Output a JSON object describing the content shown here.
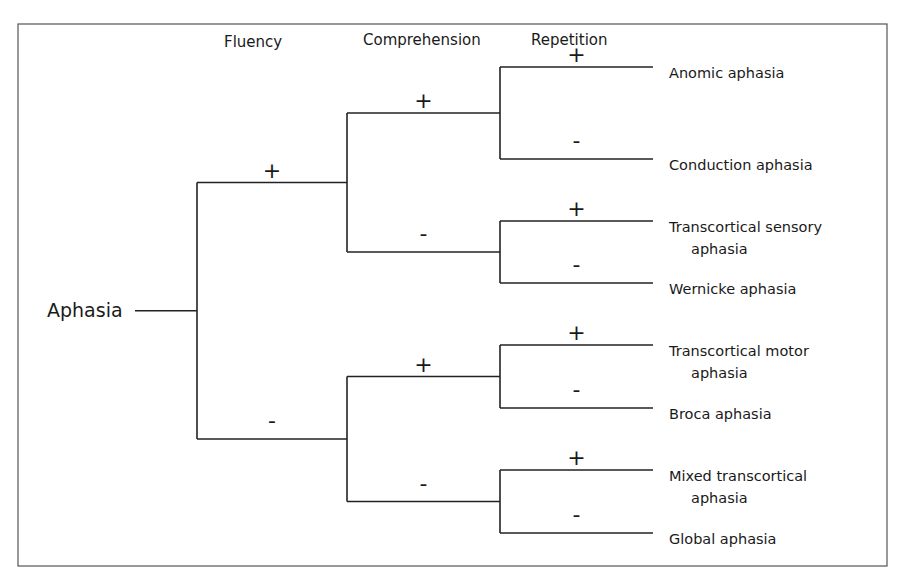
{
  "diagram": {
    "type": "decision-tree",
    "root": "Aphasia",
    "column_headers": [
      "Fluency",
      "Comprehension",
      "Repetition"
    ],
    "signs": {
      "positive": "+",
      "negative": "-"
    },
    "tree": {
      "label": "Aphasia",
      "children": [
        {
          "sign": "+",
          "feature": "Fluency",
          "children": [
            {
              "sign": "+",
              "feature": "Comprehension",
              "children": [
                {
                  "sign": "+",
                  "feature": "Repetition",
                  "leaf": [
                    "Anomic aphasia"
                  ]
                },
                {
                  "sign": "-",
                  "feature": "Repetition",
                  "leaf": [
                    "Conduction aphasia"
                  ]
                }
              ]
            },
            {
              "sign": "-",
              "feature": "Comprehension",
              "children": [
                {
                  "sign": "+",
                  "feature": "Repetition",
                  "leaf": [
                    "Transcortical sensory",
                    "aphasia"
                  ]
                },
                {
                  "sign": "-",
                  "feature": "Repetition",
                  "leaf": [
                    "Wernicke aphasia"
                  ]
                }
              ]
            }
          ]
        },
        {
          "sign": "-",
          "feature": "Fluency",
          "children": [
            {
              "sign": "+",
              "feature": "Comprehension",
              "children": [
                {
                  "sign": "+",
                  "feature": "Repetition",
                  "leaf": [
                    "Transcortical motor",
                    "aphasia"
                  ]
                },
                {
                  "sign": "-",
                  "feature": "Repetition",
                  "leaf": [
                    "Broca aphasia"
                  ]
                }
              ]
            },
            {
              "sign": "-",
              "feature": "Comprehension",
              "children": [
                {
                  "sign": "+",
                  "feature": "Repetition",
                  "leaf": [
                    "Mixed transcortical",
                    "aphasia"
                  ]
                },
                {
                  "sign": "-",
                  "feature": "Repetition",
                  "leaf": [
                    "Global aphasia"
                  ]
                }
              ]
            }
          ]
        }
      ]
    }
  }
}
